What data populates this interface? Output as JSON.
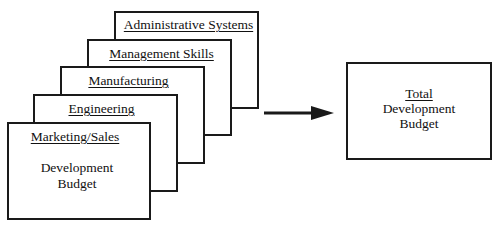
{
  "diagram": {
    "type": "stacked-cards-to-total",
    "cards": [
      {
        "label": "Administrative Systems"
      },
      {
        "label": "Management Skills"
      },
      {
        "label": "Manufacturing"
      },
      {
        "label": "Engineering"
      },
      {
        "label": "Marketing/Sales",
        "body_line1": "Development",
        "body_line2": "Budget"
      }
    ],
    "arrow": {
      "direction": "right",
      "icon": "arrow-right-icon"
    },
    "total": {
      "title": "Total",
      "line1": "Development",
      "line2": "Budget"
    },
    "colors": {
      "stroke": "#1a1a1a",
      "background": "#ffffff",
      "text": "#111111"
    }
  }
}
